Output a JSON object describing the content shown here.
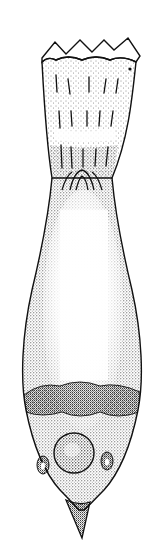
{
  "figure": {
    "type": "stippled scientific illustration",
    "colors": {
      "ink": "#111111",
      "paper": "#ffffff"
    }
  }
}
